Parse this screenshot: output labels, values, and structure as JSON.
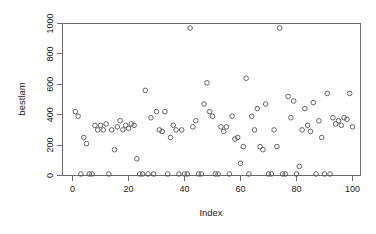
{
  "chart_data": {
    "type": "scatter",
    "title": "",
    "xlabel": "Index",
    "ylabel": "bestlam",
    "xlim": [
      -2,
      104
    ],
    "ylim": [
      -30,
      1010
    ],
    "xticks": [
      0,
      20,
      40,
      60,
      80,
      100
    ],
    "yticks": [
      0,
      200,
      400,
      600,
      800,
      1000
    ],
    "grid": false,
    "legend": null,
    "marker": "open-circle",
    "marker_color": "#555555",
    "n_points": 100,
    "x": [
      1,
      2,
      3,
      4,
      5,
      6,
      7,
      8,
      9,
      10,
      11,
      12,
      13,
      14,
      15,
      16,
      17,
      18,
      19,
      20,
      21,
      22,
      23,
      24,
      25,
      26,
      27,
      28,
      29,
      30,
      31,
      32,
      33,
      34,
      35,
      36,
      37,
      38,
      39,
      40,
      41,
      42,
      43,
      44,
      45,
      46,
      47,
      48,
      49,
      50,
      51,
      52,
      53,
      54,
      55,
      56,
      57,
      58,
      59,
      60,
      61,
      62,
      63,
      64,
      65,
      66,
      67,
      68,
      69,
      70,
      71,
      72,
      73,
      74,
      75,
      76,
      77,
      78,
      79,
      80,
      81,
      82,
      83,
      84,
      85,
      86,
      87,
      88,
      89,
      90,
      91,
      92,
      93,
      94,
      95,
      96,
      97,
      98,
      99,
      100
    ],
    "y": [
      420,
      390,
      10,
      250,
      210,
      10,
      10,
      330,
      300,
      330,
      300,
      340,
      10,
      300,
      170,
      320,
      360,
      300,
      330,
      310,
      340,
      330,
      110,
      10,
      10,
      560,
      10,
      380,
      10,
      420,
      300,
      290,
      420,
      10,
      250,
      330,
      300,
      10,
      300,
      10,
      10,
      970,
      320,
      360,
      10,
      10,
      470,
      610,
      420,
      390,
      10,
      10,
      320,
      290,
      320,
      10,
      390,
      240,
      250,
      80,
      190,
      640,
      10,
      390,
      300,
      440,
      190,
      170,
      470,
      10,
      10,
      300,
      190,
      970,
      10,
      10,
      520,
      380,
      490,
      10,
      60,
      300,
      440,
      330,
      290,
      480,
      10,
      360,
      250,
      10,
      540,
      10,
      380,
      340,
      360,
      330,
      380,
      370,
      540,
      320
    ],
    "outliers": [
      {
        "index": 42,
        "value": 970
      },
      {
        "index": 74,
        "value": 970
      }
    ],
    "axis_color": "#6b6b6b"
  },
  "plot": {
    "y_axis_title": "bestlam",
    "x_axis_title": "Index",
    "x_tick_labels": [
      "0",
      "20",
      "40",
      "60",
      "80",
      "100"
    ],
    "y_tick_labels": [
      "0",
      "200",
      "400",
      "600",
      "800",
      "1000"
    ]
  }
}
